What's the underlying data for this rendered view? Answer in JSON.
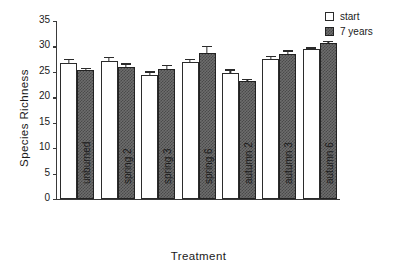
{
  "chart_data": {
    "type": "bar",
    "title": "",
    "xlabel": "Treatment",
    "ylabel": "Species Richness",
    "categories": [
      "unburned",
      "spring 2",
      "spring 3",
      "spring 6",
      "autumn 2",
      "autumn 3",
      "autumn 6"
    ],
    "ylim": [
      0,
      35
    ],
    "yticks": [
      0,
      5,
      10,
      15,
      20,
      25,
      30,
      35
    ],
    "ytick_labels": [
      "0",
      "5",
      "10",
      "15",
      "20",
      "25",
      "30",
      "35"
    ],
    "grid": false,
    "legend_position": "top-right",
    "series": [
      {
        "name": "start",
        "color": "#ffffff",
        "values": [
          26.7,
          27.1,
          24.3,
          26.9,
          24.8,
          27.6,
          29.4
        ],
        "errors": [
          0.9,
          0.9,
          0.8,
          0.6,
          0.7,
          0.6,
          0.4
        ]
      },
      {
        "name": "7 years",
        "color": "#6d6d6d",
        "values": [
          25.4,
          25.9,
          25.5,
          28.7,
          23.2,
          28.6,
          30.6
        ],
        "errors": [
          0.4,
          0.8,
          0.9,
          1.4,
          0.4,
          0.6,
          0.5
        ]
      }
    ]
  },
  "legend": {
    "items": [
      {
        "label": "start",
        "swatch": "open-square-swatch"
      },
      {
        "label": "7 years",
        "swatch": "filled-square-swatch"
      }
    ]
  },
  "axes": {
    "y_title": "Species Richness",
    "x_title": "Treatment"
  }
}
